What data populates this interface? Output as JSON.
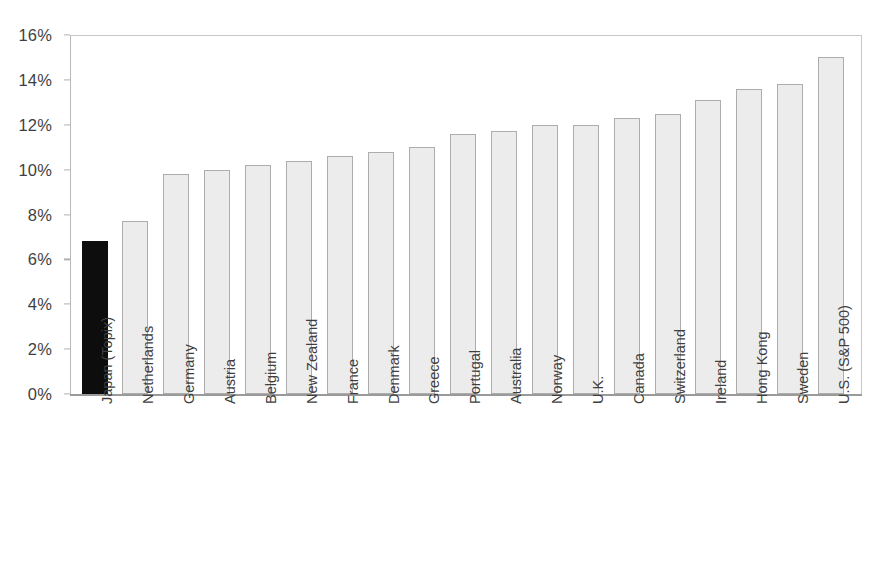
{
  "chart_data": {
    "type": "bar",
    "title": "",
    "subtitle": "",
    "xlabel": "",
    "ylabel": "",
    "ylim": [
      0,
      16
    ],
    "ytick_labels": [
      "0%",
      "2%",
      "4%",
      "6%",
      "8%",
      "10%",
      "12%",
      "14%",
      "16%"
    ],
    "ytick_values": [
      0,
      2,
      4,
      6,
      8,
      10,
      12,
      14,
      16
    ],
    "grid": false,
    "legend": null,
    "value_suffix": "%",
    "categories": [
      "Japan (Topix)",
      "Netherlands",
      "Germany",
      "Austria",
      "Belgium",
      "New Zealand",
      "France",
      "Denmark",
      "Greece",
      "Portugal",
      "Australia",
      "Norway",
      "U.K.",
      "Canada",
      "Switzerland",
      "Ireland",
      "Hong Kong",
      "Sweden",
      "U.S. (S&P 500)"
    ],
    "values": [
      6.8,
      7.7,
      9.8,
      10.0,
      10.2,
      10.4,
      10.6,
      10.8,
      11.0,
      11.6,
      11.7,
      12.0,
      12.0,
      12.3,
      12.5,
      13.1,
      13.6,
      13.8,
      15.0
    ],
    "highlight_index": 0,
    "colors": {
      "bar_fill": "#ececec",
      "bar_border": "#adadad",
      "highlight_fill": "#0d0d0d",
      "axis": "#9a9a9a",
      "frame": "#c8c8c8",
      "text": "#3f3f3f",
      "background": "#ffffff"
    }
  },
  "caption": {
    "text": ""
  }
}
